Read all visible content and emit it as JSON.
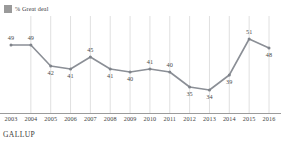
{
  "legend": {
    "swatch_icon": "legend-swatch-square",
    "swatch_color": "#9a9a9a",
    "label": "% Great deal"
  },
  "footer": {
    "source": "GALLUP"
  },
  "style": {
    "line_color": "#8b8f96",
    "marker_color": "#7f838a",
    "gridline_color": "#d8d8d8",
    "axis_color": "#9b9b9b"
  },
  "chart_data": {
    "type": "line",
    "title": "",
    "subtitle": "",
    "xlabel": "",
    "ylabel": "",
    "legend_position": "top-left",
    "grid": "vertical",
    "ylim": [
      30,
      54
    ],
    "categories": [
      "2003",
      "2004",
      "2005",
      "2006",
      "2007",
      "2008",
      "2009",
      "2010",
      "2011",
      "2012",
      "2013",
      "2014",
      "2015",
      "2016"
    ],
    "series": [
      {
        "name": "% Great deal",
        "values": [
          49,
          49,
          42,
          41,
          45,
          41,
          40,
          41,
          40,
          35,
          34,
          39,
          51,
          48
        ],
        "labels": [
          "49",
          "49",
          "42",
          "41",
          "45",
          "41",
          "40",
          "41",
          "40",
          "35",
          "34",
          "39",
          "51",
          "48"
        ],
        "label_positions": [
          "above",
          "above",
          "below",
          "below",
          "above",
          "below",
          "below",
          "above",
          "above",
          "below",
          "below",
          "below",
          "above",
          "below"
        ]
      }
    ]
  }
}
